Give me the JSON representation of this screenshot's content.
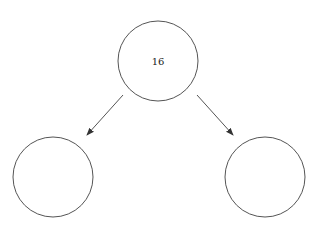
{
  "diagram": {
    "type": "binary-tree",
    "colors": {
      "stroke": "#555555",
      "text": "#222222",
      "background": "#ffffff"
    },
    "nodes": [
      {
        "id": "root",
        "label": "16",
        "cx": 158,
        "cy": 61,
        "r": 40
      },
      {
        "id": "left-child",
        "label": "",
        "cx": 53,
        "cy": 177,
        "r": 40
      },
      {
        "id": "right-child",
        "label": "",
        "cx": 265,
        "cy": 177,
        "r": 40
      }
    ],
    "edges": [
      {
        "from": "root",
        "to": "left-child"
      },
      {
        "from": "root",
        "to": "right-child"
      }
    ]
  }
}
